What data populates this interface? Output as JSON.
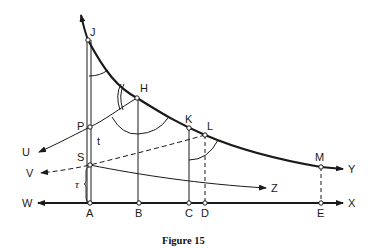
{
  "figure": {
    "caption": "Figure 15",
    "points": {
      "J": "J",
      "H": "H",
      "K": "K",
      "L": "L",
      "M": "M",
      "P": "P",
      "S": "S",
      "A": "A",
      "B": "B",
      "C": "C",
      "D": "D",
      "E": "E"
    },
    "arrows": {
      "U": "U",
      "V": "V",
      "W": "W",
      "X": "X",
      "Y": "Y",
      "Z": "Z"
    },
    "segment_labels": {
      "t": "t",
      "tau": "τ"
    },
    "colors": {
      "ink": "#1a1a1a",
      "background": "#ffffff"
    }
  }
}
